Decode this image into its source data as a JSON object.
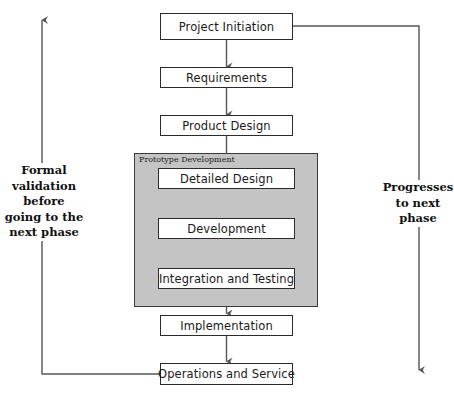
{
  "diagram": {
    "nodes": [
      {
        "id": "project-initiation",
        "label": "Project Initiation"
      },
      {
        "id": "requirements",
        "label": "Requirements"
      },
      {
        "id": "product-design",
        "label": "Product Design"
      },
      {
        "id": "detailed-design",
        "label": "Detailed Design"
      },
      {
        "id": "development",
        "label": "Development"
      },
      {
        "id": "integration-testing",
        "label": "Integration and Testing"
      },
      {
        "id": "implementation",
        "label": "Implementation"
      },
      {
        "id": "operations-service",
        "label": "Operations and Service"
      }
    ],
    "group": {
      "id": "prototype-development",
      "label": "Prototype Development",
      "fill": "#c4c4c4",
      "border": "#3a3a3a"
    },
    "annotations": [
      {
        "id": "formal-validation-note",
        "side": "left",
        "text": "Formal\nvalidation\nbefore\ngoing to the\nnext phase"
      },
      {
        "id": "progresses-note",
        "side": "right",
        "text": "Progresses\nto next\nphase"
      }
    ],
    "flow": [
      "Project Initiation",
      "Requirements",
      "Product Design",
      "Detailed Design",
      "Development",
      "Integration and Testing",
      "Implementation",
      "Operations and Service"
    ],
    "feedback_loops": [
      {
        "id": "left-feedback-loop",
        "from": "Operations and Service",
        "direction": "upward",
        "note": "Formal validation before going to the next phase"
      },
      {
        "id": "right-progress-loop",
        "from": "Project Initiation",
        "direction": "downward",
        "note": "Progresses to next phase"
      }
    ],
    "colors": {
      "line": "#555555",
      "node_border": "#2b2b2b",
      "node_fill": "#ffffff",
      "group_fill": "#c4c4c4",
      "text": "#1a1a1a"
    }
  }
}
